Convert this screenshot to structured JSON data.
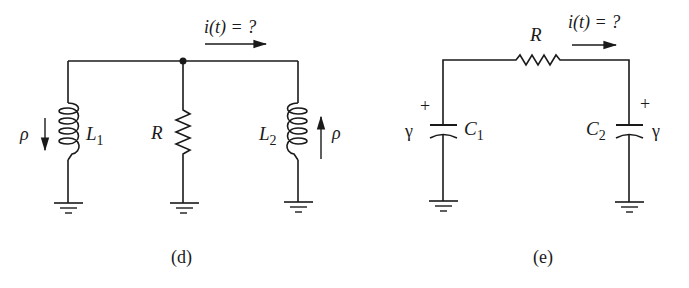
{
  "figures": [
    {
      "id": "d",
      "caption": "(d)",
      "current_label": "i(t) = ?",
      "components": {
        "L1": {
          "name": "L",
          "sub": "1",
          "source_label": "ρ",
          "arrow": "down"
        },
        "R": {
          "name": "R"
        },
        "L2": {
          "name": "L",
          "sub": "2",
          "source_label": "ρ",
          "arrow": "up"
        }
      }
    },
    {
      "id": "e",
      "caption": "(e)",
      "current_label": "i(t) = ?",
      "components": {
        "R": {
          "name": "R"
        },
        "C1": {
          "name": "C",
          "sub": "1",
          "voltage_label": "γ",
          "polarity": "+"
        },
        "C2": {
          "name": "C",
          "sub": "2",
          "voltage_label": "γ",
          "polarity": "+"
        }
      }
    }
  ]
}
